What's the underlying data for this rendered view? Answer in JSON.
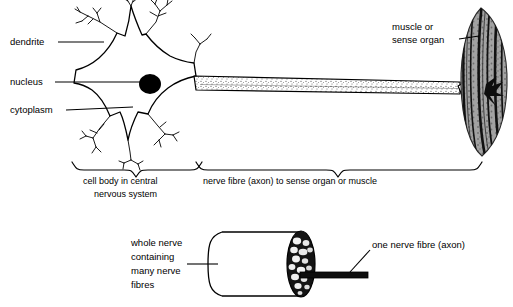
{
  "figure": {
    "background_color": "#ffffff",
    "ink_color": "#000000"
  },
  "labels": {
    "dendrite": "dendrite",
    "nucleus": "nucleus",
    "cytoplasm": "cytoplasm",
    "muscle_line1": "muscle or",
    "muscle_line2": "sense organ",
    "brace_cell_body_line1": "cell body in central",
    "brace_cell_body_line2": "nervous system",
    "brace_axon": "nerve fibre (axon) to sense organ or muscle",
    "whole_nerve_line1": "whole nerve",
    "whole_nerve_line2": "containing",
    "whole_nerve_line3": "many nerve",
    "whole_nerve_line4": "fibres",
    "one_fibre": "one nerve fibre (axon)"
  },
  "parts": {
    "soma": "cell-body-soma",
    "nucleus_shape": "nucleus-blob",
    "axon": "axon-tube",
    "target": "muscle-sense-organ",
    "nerve_bundle": "whole-nerve-cylinder",
    "cross_section": "nerve-cross-section",
    "single_fibre": "single-fibre-rod"
  },
  "colors": {
    "stipple": "#1a1a1a",
    "muscle_grey": "#9a9a9a",
    "muscle_stripe": "#111111",
    "nucleus_fill": "#000000"
  }
}
